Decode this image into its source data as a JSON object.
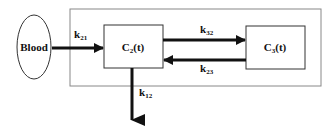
{
  "diagram": {
    "type": "compartment-model",
    "nodes": {
      "blood": {
        "label": "Blood"
      },
      "c2": {
        "label_main": "C",
        "label_sub": "2",
        "label_suffix": "(t)"
      },
      "c3": {
        "label_main": "C",
        "label_sub": "3",
        "label_suffix": "(t)"
      }
    },
    "edges": {
      "k21": {
        "main": "k",
        "sub": "21",
        "from": "Blood",
        "to": "C2(t)"
      },
      "k32": {
        "main": "k",
        "sub": "32",
        "from": "C2(t)",
        "to": "C3(t)"
      },
      "k23": {
        "main": "k",
        "sub": "23",
        "from": "C3(t)",
        "to": "C2(t)"
      },
      "k12": {
        "main": "k",
        "sub": "12",
        "from": "C2(t)",
        "to": "out"
      }
    },
    "colors": {
      "stroke": "#111111",
      "outer_box": "#888888",
      "background": "#ffffff"
    }
  }
}
